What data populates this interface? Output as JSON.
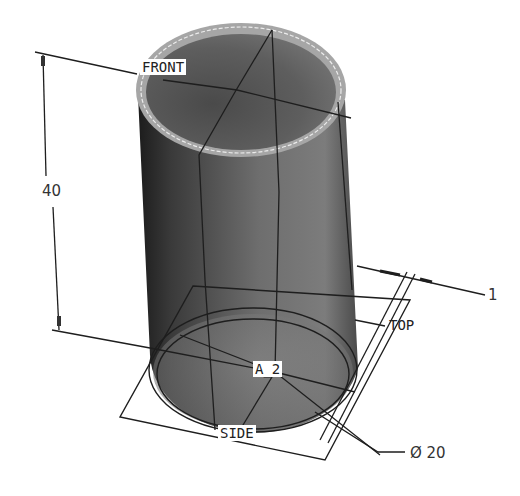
{
  "view": {
    "type": "3D CAD model view - hollow cylinder (tube)",
    "colors": {
      "background": "#ffffff",
      "shell_dark": "#2a2a2a",
      "shell_mid": "#6a6a6a",
      "shell_light": "#9a9a9a",
      "rim": "#a8a8a8",
      "edge_highlight": "#e8e8e8",
      "lines": "#1e1e1e"
    }
  },
  "datum_planes": {
    "front": "FRONT",
    "top": "TOP",
    "side": "SIDE"
  },
  "datum_axis": "A_2",
  "dimensions": {
    "height": "40",
    "diameter": "Ø 20",
    "thickness": "1"
  }
}
